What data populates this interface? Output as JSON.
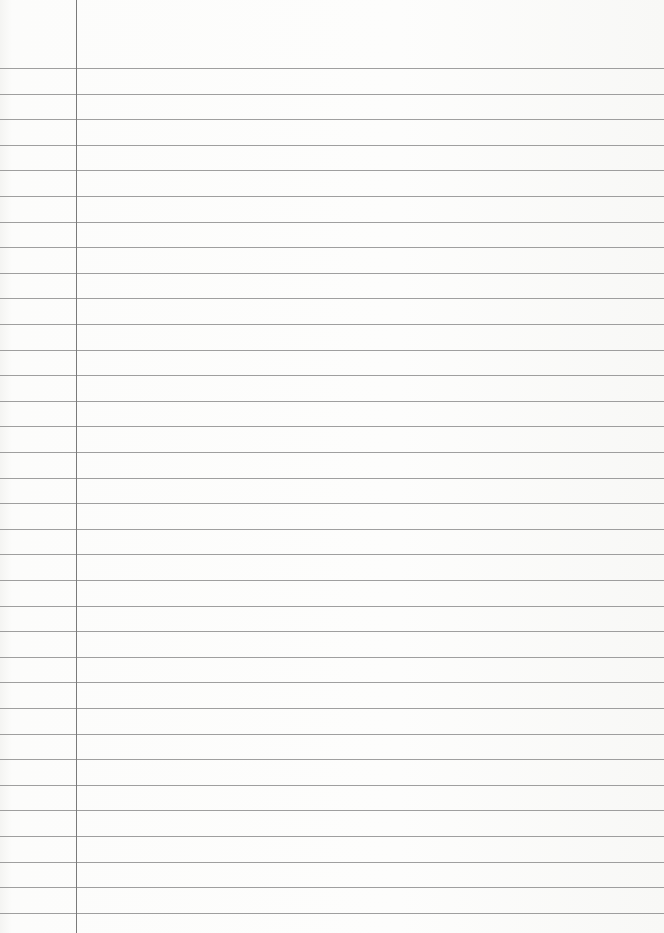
{
  "page": {
    "type": "ruled-paper",
    "background_color": "#fbfbfa",
    "rule_color": "#8e8e8e",
    "margin_line_color": "#7a7a7a",
    "margin_line_x": 76,
    "first_rule_y": 68,
    "rule_spacing": 25.6,
    "rule_count": 34
  }
}
